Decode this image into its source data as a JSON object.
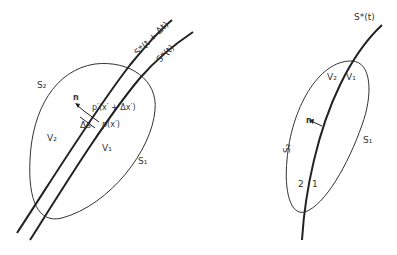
{
  "left_figure": {
    "front_new_label": "S*(t + Δt)",
    "front_old_label": "S*(t)",
    "surface_2_label": "S₂",
    "surface_1_label": "S₁",
    "normal_label": "n",
    "point_new_label": "p′(x′ + Δx′)",
    "point_old_label": "p(x′)",
    "distance_label": "Δs",
    "volume_2_label": "V₂",
    "volume_1_label": "V₁"
  },
  "right_figure": {
    "front_label": "S*(t)",
    "surface_2_label": "S₂",
    "surface_1_label": "S₁",
    "normal_label": "n",
    "volume_2_label": "V₂",
    "volume_1_label": "V₁",
    "side_2_label": "2",
    "side_1_label": "1"
  },
  "colors": {
    "ink": "#333333",
    "background": "#ffffff"
  }
}
